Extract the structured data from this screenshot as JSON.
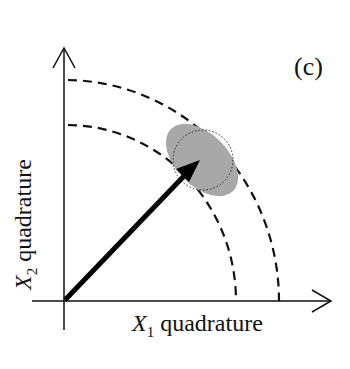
{
  "diagram": {
    "panel_label": "(c)",
    "x_axis": {
      "variable": "X",
      "subscript": "1",
      "label": "quadrature"
    },
    "y_axis": {
      "variable": "X",
      "subscript": "2",
      "label": "quadrature"
    },
    "elements": [
      {
        "type": "arrow",
        "description": "coherent amplitude vector from origin"
      },
      {
        "type": "dashed-arc",
        "description": "inner amplitude circle"
      },
      {
        "type": "dashed-arc",
        "description": "outer amplitude circle"
      },
      {
        "type": "dotted-circle",
        "description": "coherent state uncertainty circle"
      },
      {
        "type": "gray-ellipse",
        "description": "squeezed state uncertainty ellipse"
      }
    ],
    "colors": {
      "ink": "#111111",
      "ellipse_fill": "#a8a8a8"
    }
  }
}
